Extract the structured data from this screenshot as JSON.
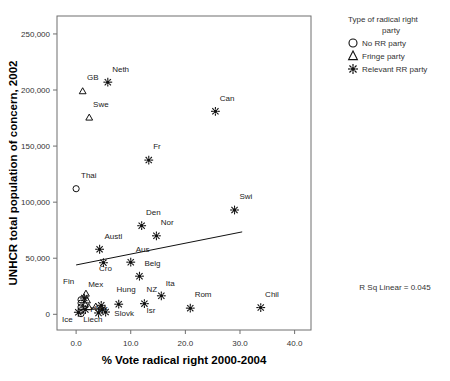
{
  "chart_data": {
    "type": "scatter",
    "title": "",
    "xlabel": "% Vote radical right 2000-2004",
    "ylabel": "UNHCR total population of concern, 2002",
    "xlim": [
      -3.5,
      43.0
    ],
    "ylim": [
      -14000,
      266000
    ],
    "xticks": [
      "0.0",
      "10.0",
      "20.0",
      "30.0",
      "40.0"
    ],
    "xtick_values": [
      0,
      10,
      20,
      30,
      40
    ],
    "yticks": [
      "0",
      "50,000",
      "100,000",
      "150,000",
      "200,000",
      "250,000"
    ],
    "ytick_values": [
      0,
      50000,
      100000,
      150000,
      200000,
      250000
    ],
    "grid": false,
    "annotation": "R Sq Linear = 0.045",
    "fit_line": {
      "x0": 0.0,
      "y0": 44000,
      "x1": 30.4,
      "y1": 73500
    },
    "legend": {
      "title": "Type of radical right party",
      "position": "top-right-outside",
      "entries": [
        {
          "marker": "circle",
          "label": "No RR party"
        },
        {
          "marker": "triangle",
          "label": "Fringe party"
        },
        {
          "marker": "star",
          "label": "Relevant RR party"
        }
      ]
    },
    "points": [
      {
        "label": "Neth",
        "x": 5.8,
        "y": 207000,
        "marker": "star",
        "lx": 6.6,
        "ly": 216000
      },
      {
        "label": "GB",
        "x": 1.2,
        "y": 199000,
        "marker": "triangle",
        "lx": 2.0,
        "ly": 209000
      },
      {
        "label": "Swe",
        "x": 2.4,
        "y": 175500,
        "marker": "triangle",
        "lx": 3.1,
        "ly": 185000
      },
      {
        "label": "Can",
        "x": 25.5,
        "y": 181000,
        "marker": "star",
        "lx": 26.3,
        "ly": 190000
      },
      {
        "label": "Fr",
        "x": 13.3,
        "y": 137500,
        "marker": "star",
        "lx": 14.1,
        "ly": 147000
      },
      {
        "label": "Thai",
        "x": 0.0,
        "y": 112000,
        "marker": "circle",
        "lx": 0.9,
        "ly": 121500
      },
      {
        "label": "Swi",
        "x": 29.0,
        "y": 93000,
        "marker": "star",
        "lx": 29.9,
        "ly": 102500
      },
      {
        "label": "Den",
        "x": 12.0,
        "y": 79000,
        "marker": "star",
        "lx": 12.8,
        "ly": 88500
      },
      {
        "label": "Nor",
        "x": 14.7,
        "y": 70000,
        "marker": "star",
        "lx": 15.5,
        "ly": 79500
      },
      {
        "label": "Austl",
        "x": 4.3,
        "y": 58000,
        "marker": "star",
        "lx": 5.2,
        "ly": 67500
      },
      {
        "label": "Aus",
        "x": 10.0,
        "y": 46500,
        "marker": "star",
        "lx": 10.9,
        "ly": 55500
      },
      {
        "label": "Cro",
        "x": 5.0,
        "y": 46000,
        "marker": "star",
        "lx": 4.2,
        "ly": 38500
      },
      {
        "label": "Belg",
        "x": 11.6,
        "y": 34000,
        "marker": "star",
        "lx": 12.5,
        "ly": 43000
      },
      {
        "label": "Ita",
        "x": 15.6,
        "y": 16500,
        "marker": "star",
        "lx": 16.4,
        "ly": 25500
      },
      {
        "label": "Rom",
        "x": 20.9,
        "y": 5500,
        "marker": "star",
        "lx": 21.7,
        "ly": 15000
      },
      {
        "label": "Chil",
        "x": 33.8,
        "y": 6000,
        "marker": "star",
        "lx": 34.6,
        "ly": 15500
      },
      {
        "label": "NZ",
        "x": 12.5,
        "y": 9500,
        "marker": "star",
        "lx": 12.9,
        "ly": 19500
      },
      {
        "label": "Isr",
        "x": 12.5,
        "y": 9500,
        "marker": "none",
        "lx": 12.9,
        "ly": 1500
      },
      {
        "label": "Hung",
        "x": 7.8,
        "y": 9000,
        "marker": "star",
        "lx": 7.4,
        "ly": 19500
      },
      {
        "label": "Slovk",
        "x": 7.8,
        "y": 5000,
        "marker": "none",
        "lx": 7.0,
        "ly": -1500
      },
      {
        "label": "Mex",
        "x": 1.8,
        "y": 18500,
        "marker": "triangle",
        "lx": 2.2,
        "ly": 24500
      },
      {
        "label": "Fin",
        "x": 0.9,
        "y": 16000,
        "marker": "none",
        "lx": -2.4,
        "ly": 27000
      },
      {
        "label": "Nor2",
        "x": 3.6,
        "y": 7000,
        "marker": "triangle",
        "lx": 3.4,
        "ly": 2500
      },
      {
        "label": "Por",
        "x": 2.6,
        "y": 3500,
        "marker": "none",
        "lx": 2.6,
        "ly": 2000
      },
      {
        "label": "Liech",
        "x": 2.2,
        "y": 1500,
        "marker": "none",
        "lx": 1.3,
        "ly": -6500
      },
      {
        "label": "Ice",
        "x": 0.0,
        "y": 1500,
        "marker": "none",
        "lx": -2.6,
        "ly": -6500
      },
      {
        "label": "c1",
        "x": 0.9,
        "y": 13000,
        "marker": "circle",
        "lx": null,
        "ly": null
      },
      {
        "label": "c2",
        "x": 0.9,
        "y": 10000,
        "marker": "circle",
        "lx": null,
        "ly": null
      },
      {
        "label": "c3",
        "x": 0.9,
        "y": 6500,
        "marker": "circle",
        "lx": null,
        "ly": null
      },
      {
        "label": "c4",
        "x": 0.9,
        "y": 3200,
        "marker": "circle",
        "lx": null,
        "ly": null
      },
      {
        "label": "c5",
        "x": 0.9,
        "y": 600,
        "marker": "circle",
        "lx": null,
        "ly": null
      },
      {
        "label": "t1",
        "x": 2.0,
        "y": 12500,
        "marker": "triangle",
        "lx": null,
        "ly": null
      },
      {
        "label": "t2",
        "x": 1.6,
        "y": 9500,
        "marker": "triangle",
        "lx": null,
        "ly": null
      },
      {
        "label": "t3",
        "x": 2.3,
        "y": 6500,
        "marker": "triangle",
        "lx": null,
        "ly": null
      },
      {
        "label": "s1",
        "x": 1.5,
        "y": 14500,
        "marker": "star",
        "lx": null,
        "ly": null
      },
      {
        "label": "s2",
        "x": 1.7,
        "y": 4200,
        "marker": "star",
        "lx": null,
        "ly": null
      },
      {
        "label": "s3",
        "x": 4.6,
        "y": 8000,
        "marker": "star",
        "lx": null,
        "ly": null
      },
      {
        "label": "s4",
        "x": 4.8,
        "y": 4500,
        "marker": "star",
        "lx": null,
        "ly": null
      },
      {
        "label": "s5",
        "x": 5.4,
        "y": 2000,
        "marker": "star",
        "lx": null,
        "ly": null
      },
      {
        "label": "s6",
        "x": 4.1,
        "y": 1200,
        "marker": "star",
        "lx": null,
        "ly": null
      },
      {
        "label": "s7",
        "x": 0.4,
        "y": 1800,
        "marker": "star",
        "lx": null,
        "ly": null
      }
    ]
  }
}
